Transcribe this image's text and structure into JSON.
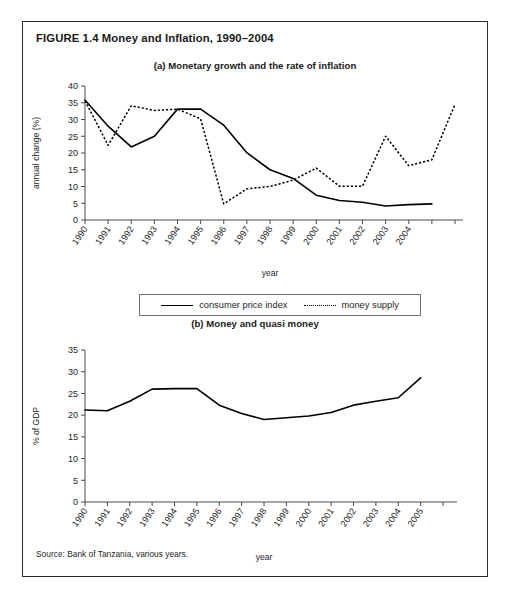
{
  "figure": {
    "title": "FIGURE 1.4  Money and Inflation, 1990–2004",
    "source": "Source: Bank of Tanzania, various years."
  },
  "legend": {
    "entries": [
      {
        "label": "consumer price index",
        "style": "solid"
      },
      {
        "label": "money supply",
        "style": "dotted"
      }
    ]
  },
  "chart_data": [
    {
      "id": "panel-a",
      "type": "line",
      "title": "(a) Monetary growth and the rate of inflation",
      "xlabel": "year",
      "ylabel": "annual change (%)",
      "ylim": [
        0,
        40
      ],
      "yticks": [
        0,
        5,
        10,
        15,
        20,
        25,
        30,
        35,
        40
      ],
      "grid": false,
      "legend_position": "below",
      "categories": [
        "1990",
        "1991",
        "1992",
        "1993",
        "1994",
        "1995",
        "1996",
        "1997",
        "1998",
        "1999",
        "2000",
        "2001",
        "2002",
        "2003",
        "2004",
        ""
      ],
      "series": [
        {
          "name": "consumer price index",
          "style": "solid",
          "values": [
            35.8,
            28.0,
            21.8,
            25.0,
            33.1,
            33.1,
            28.3,
            20.1,
            15.0,
            12.4,
            7.4,
            5.8,
            5.3,
            4.2,
            4.6,
            4.8
          ]
        },
        {
          "name": "money supply",
          "style": "dotted",
          "values": [
            35.6,
            22.3,
            34.1,
            32.7,
            33.1,
            30.2,
            4.8,
            9.3,
            10.0,
            11.9,
            15.5,
            10.1,
            10.1,
            25.0,
            16.2,
            18.0,
            34.5
          ]
        }
      ]
    },
    {
      "id": "panel-b",
      "type": "line",
      "title": "(b) Money and quasi money",
      "xlabel": "year",
      "ylabel": "% of GDP",
      "ylim": [
        0,
        35
      ],
      "yticks": [
        0,
        5,
        10,
        15,
        20,
        25,
        30,
        35
      ],
      "grid": false,
      "categories": [
        "1990",
        "1991",
        "1992",
        "1993",
        "1994",
        "1995",
        "1996",
        "1997",
        "1998",
        "1999",
        "2000",
        "2001",
        "2002",
        "2003",
        "2004",
        "2005"
      ],
      "series": [
        {
          "name": "money and quasi money",
          "style": "solid",
          "values": [
            21.2,
            21.0,
            23.2,
            26.0,
            26.1,
            26.1,
            22.3,
            20.4,
            19.0,
            19.4,
            19.8,
            20.6,
            22.3,
            23.2,
            24.0,
            28.6
          ]
        }
      ]
    }
  ]
}
